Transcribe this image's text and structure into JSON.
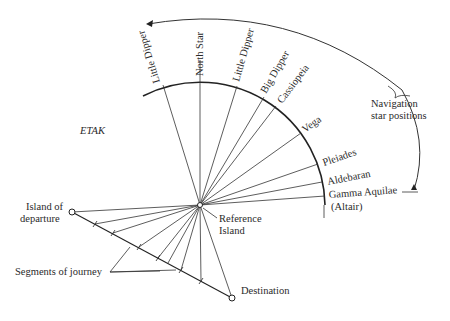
{
  "diagram": {
    "title": "ETAK",
    "center_label": [
      "Reference",
      "Island"
    ],
    "departure_label": [
      "Island of",
      "departure"
    ],
    "destination_label": "Destination",
    "segments_label": "Segments of journey",
    "range_label": [
      "Navigation",
      "star positions"
    ],
    "stars": [
      {
        "name": "Little Dipper",
        "angle_deg": 107
      },
      {
        "name": "North Star",
        "angle_deg": 90
      },
      {
        "name": "Little Dipper",
        "angle_deg": 74
      },
      {
        "name": "Big Dipper",
        "angle_deg": 60
      },
      {
        "name": "Cassiopeia",
        "angle_deg": 53
      },
      {
        "name": "Vega",
        "angle_deg": 36
      },
      {
        "name": "Pleiades",
        "angle_deg": 19
      },
      {
        "name": "Aldebaran",
        "angle_deg": 11
      },
      {
        "name": "Gamma Aquilae",
        "angle_deg": 4
      },
      {
        "name": "(Altair)",
        "angle_deg": 0
      }
    ]
  }
}
